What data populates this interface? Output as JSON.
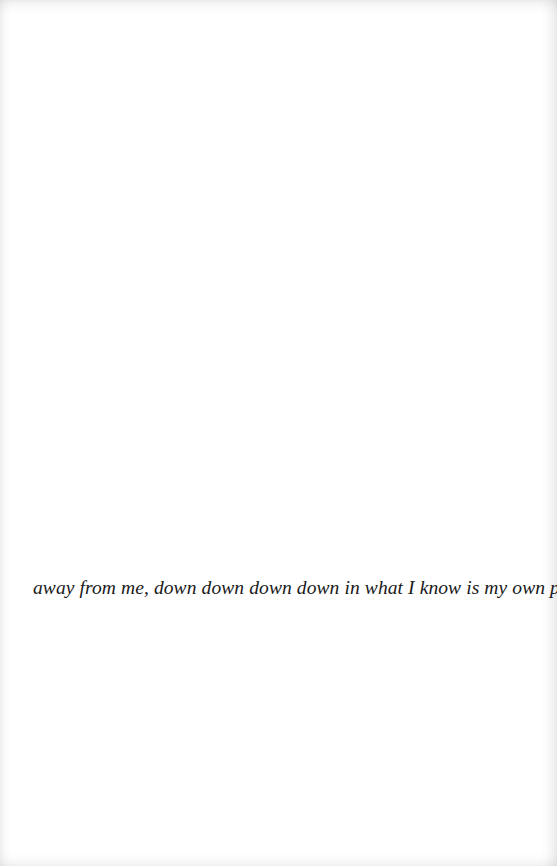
{
  "page": {
    "background_color": "#ffffff",
    "text_color": "#1a1a1a",
    "lines": [
      "away from me, down down down down in what I know is my own passage, as"
    ]
  }
}
